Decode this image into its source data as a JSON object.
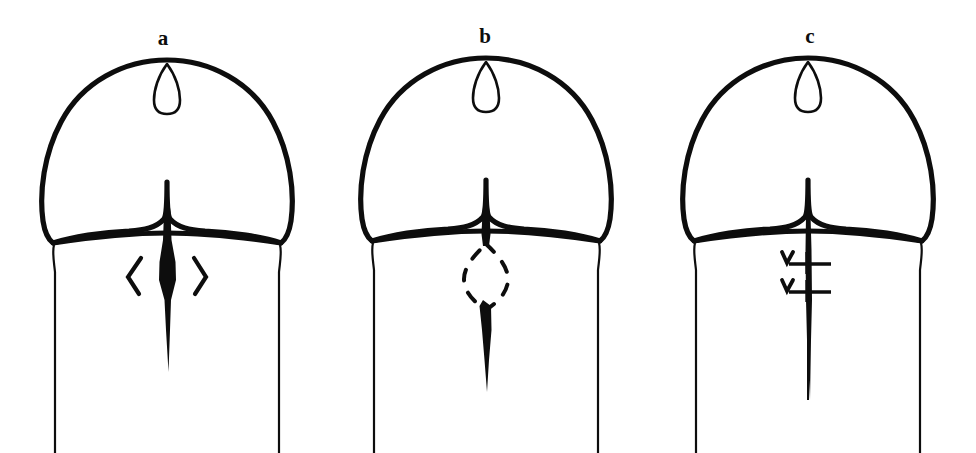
{
  "figure": {
    "background_color": "#ffffff",
    "ink_color": "#0d0d0d",
    "width": 976,
    "height": 453,
    "panel_count": 3
  },
  "panels": [
    {
      "id": "a",
      "label": "a",
      "label_x": 163,
      "label_y": 44,
      "center_x": 167,
      "description": "ventral slit with widened mid portion flanked by opposing arrowhead markers",
      "markers": {
        "type": "arrowheads",
        "left_symbol": "<",
        "right_symbol": ">",
        "count": 2
      },
      "meatus": {
        "cx": 167,
        "cy": 88,
        "rx": 13,
        "ry": 24
      },
      "slit": {
        "top_y": 182,
        "bottom_y": 372,
        "widest_y": 272,
        "max_width": 17
      }
    },
    {
      "id": "b",
      "label": "b",
      "label_x": 485,
      "label_y": 42,
      "center_x": 486,
      "description": "dashed lenticular outline marking the planned excision, slit interrupted at the marked segment",
      "markers": {
        "type": "dashed-excision-outline",
        "shape": "lenticular",
        "cx": 486,
        "cy": 277,
        "rx": 22,
        "ry": 33
      },
      "meatus": {
        "cx": 486,
        "cy": 86,
        "rx": 13,
        "ry": 24
      },
      "slit": {
        "top_y": 180,
        "upper_end_y": 246,
        "lower_start_y": 300,
        "bottom_y": 392,
        "max_width": 13
      }
    },
    {
      "id": "c",
      "label": "c",
      "label_x": 810,
      "label_y": 42,
      "center_x": 808,
      "description": "closed midline incision secured with two interrupted sutures",
      "markers": {
        "type": "sutures",
        "count": 2,
        "suture_y_positions": [
          259,
          287
        ],
        "bar_left_x": 788,
        "bar_right_x": 830,
        "knot_side": "left"
      },
      "meatus": {
        "cx": 808,
        "cy": 86,
        "rx": 13,
        "ry": 24
      },
      "slit": {
        "top_y": 180,
        "bottom_y": 400,
        "max_width": 6
      }
    }
  ],
  "geometry": {
    "glans": {
      "apex_y": 60,
      "corona_y": 243,
      "half_width": 125,
      "notch_depth_y": 182,
      "lobe_dip_y": 228
    },
    "shaft": {
      "half_width": 111,
      "top_y": 243,
      "bottom_y": 453
    }
  }
}
